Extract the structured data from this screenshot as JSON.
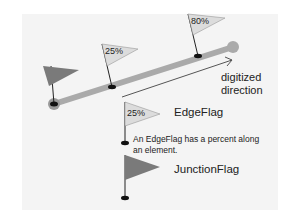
{
  "diagram": {
    "colors": {
      "background": "#ffffff",
      "panel": "#f4f4f4",
      "line": "#aaaaaa",
      "junction_flag": "#7a7a7a",
      "edge_flag": "#dcdcdc",
      "text": "#222222"
    },
    "element": {
      "edge_flags": [
        {
          "percent_label": "25%"
        },
        {
          "percent_label": "80%"
        }
      ]
    },
    "direction_label_line1": "digitized",
    "direction_label_line2": "direction",
    "legend": {
      "edge_flag": {
        "sample_percent": "25%",
        "name": "EdgeFlag",
        "description_line1": "An EdgeFlag has a percent along",
        "description_line2": "an element."
      },
      "junction_flag": {
        "name": "JunctionFlag"
      }
    }
  }
}
